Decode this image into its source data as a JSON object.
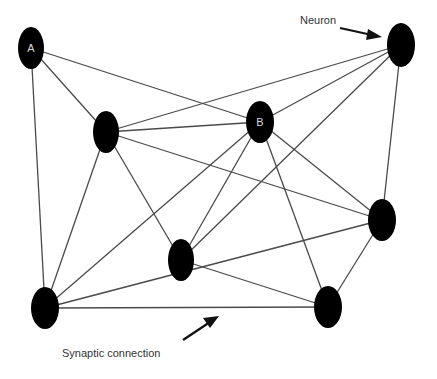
{
  "diagram": {
    "type": "neural network graph",
    "nodes": [
      {
        "id": "A",
        "label": "A",
        "cx": 31,
        "cy": 48,
        "rx": 13,
        "ry": 21
      },
      {
        "id": "N2",
        "label": "",
        "cx": 106,
        "cy": 132,
        "rx": 13,
        "ry": 21
      },
      {
        "id": "B",
        "label": "B",
        "cx": 260,
        "cy": 122,
        "rx": 14,
        "ry": 21
      },
      {
        "id": "Neuron",
        "label": "",
        "cx": 401,
        "cy": 45,
        "rx": 14,
        "ry": 22
      },
      {
        "id": "N5",
        "label": "",
        "cx": 382,
        "cy": 220,
        "rx": 14,
        "ry": 21
      },
      {
        "id": "N6",
        "label": "",
        "cx": 181,
        "cy": 260,
        "rx": 13,
        "ry": 21
      },
      {
        "id": "N7",
        "label": "",
        "cx": 45,
        "cy": 308,
        "rx": 14,
        "ry": 21
      },
      {
        "id": "N8",
        "label": "",
        "cx": 328,
        "cy": 307,
        "rx": 14,
        "ry": 21
      }
    ],
    "edges": [
      [
        "A",
        "N2"
      ],
      [
        "A",
        "B"
      ],
      [
        "A",
        "N7"
      ],
      [
        "N2",
        "Neuron"
      ],
      [
        "N2",
        "B"
      ],
      [
        "N2",
        "N5"
      ],
      [
        "N2",
        "N6"
      ],
      [
        "N2",
        "N7"
      ],
      [
        "B",
        "Neuron"
      ],
      [
        "B",
        "N5"
      ],
      [
        "B",
        "N8"
      ],
      [
        "B",
        "N6"
      ],
      [
        "B",
        "N7"
      ],
      [
        "Neuron",
        "N6"
      ],
      [
        "Neuron",
        "N5"
      ],
      [
        "N7",
        "N5"
      ],
      [
        "N5",
        "N8"
      ],
      [
        "N6",
        "N8"
      ],
      [
        "N7",
        "N8"
      ]
    ],
    "annotations": {
      "neuron_label": "Neuron",
      "synapse_label": "Synaptic connection"
    }
  }
}
